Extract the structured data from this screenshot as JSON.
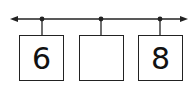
{
  "number_line": {
    "arrows": "both",
    "tick_count": 3,
    "color": "#222222"
  },
  "boxes": [
    {
      "value": "6"
    },
    {
      "value": ""
    },
    {
      "value": "8"
    }
  ]
}
